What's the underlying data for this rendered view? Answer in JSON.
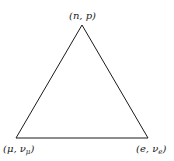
{
  "diagram": {
    "type": "triangle",
    "vertices": [
      {
        "id": "top",
        "label_open": "(",
        "label_main": "n, p",
        "label_sub": "",
        "label_close": ")"
      },
      {
        "id": "bottom-left",
        "label_open": "(",
        "label_main": "μ, ν",
        "label_sub": "μ",
        "label_close": ")"
      },
      {
        "id": "bottom-right",
        "label_open": "(",
        "label_main": "e, ν",
        "label_sub": "e",
        "label_close": ")"
      }
    ],
    "edges": [
      {
        "from": "top",
        "to": "bottom-left"
      },
      {
        "from": "top",
        "to": "bottom-right"
      },
      {
        "from": "bottom-left",
        "to": "bottom-right"
      }
    ],
    "line_color": "#1a1a1a"
  }
}
